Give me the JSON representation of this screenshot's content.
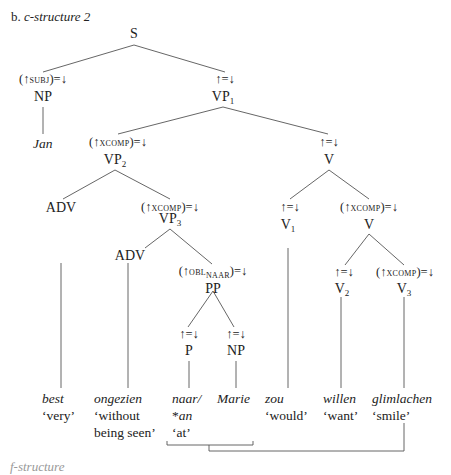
{
  "title": {
    "label": "b.",
    "text": "c-structure 2"
  },
  "nodes": {
    "S": {
      "cat": "S"
    },
    "NP_subj": {
      "ann_pre": "(↑",
      "ann_sc": "subj",
      "ann_post": ")=↓",
      "cat": "NP"
    },
    "VP1": {
      "ann": "↑=↓",
      "cat": "VP",
      "sub": "1"
    },
    "VP2": {
      "ann_pre": "(↑",
      "ann_sc": "xcomp",
      "ann_post": ")=↓",
      "cat": "VP",
      "sub": "2"
    },
    "V_top": {
      "ann": "↑=↓",
      "cat": "V"
    },
    "ADV1": {
      "cat": "ADV"
    },
    "VP3": {
      "ann_pre": "(↑",
      "ann_sc": "xcomp",
      "ann_post": ")=↓",
      "cat": "VP",
      "sub": "3"
    },
    "V1": {
      "ann": "↑=↓",
      "cat": "V",
      "sub": "1"
    },
    "V_mid": {
      "ann_pre": "(↑",
      "ann_sc": "xcomp",
      "ann_post": ")=↓",
      "cat": "V"
    },
    "ADV2": {
      "cat": "ADV"
    },
    "PP": {
      "ann_pre": "(↑",
      "ann_sc": "obl",
      "ann_sub": "naar",
      "ann_post": ")=↓",
      "cat": "PP"
    },
    "V2": {
      "ann": "↑=↓",
      "cat": "V",
      "sub": "2"
    },
    "V3": {
      "ann_pre": "(↑",
      "ann_sc": "xcomp",
      "ann_post": ")=↓",
      "cat": "V",
      "sub": "3"
    },
    "P": {
      "ann": "↑=↓",
      "cat": "P"
    },
    "NP_obj": {
      "ann": "↑=↓",
      "cat": "NP"
    }
  },
  "words": {
    "jan": {
      "form": "Jan"
    },
    "best": {
      "form": "best",
      "gloss": "‘very’"
    },
    "ongezien": {
      "form": "ongezien",
      "gloss1": "‘without",
      "gloss2": "being seen’"
    },
    "naar": {
      "form": "naar/",
      "form2": "*an",
      "gloss": "‘at’"
    },
    "marie": {
      "form": "Marie"
    },
    "zou": {
      "form": "zou",
      "gloss": "‘would’"
    },
    "willen": {
      "form": "willen",
      "gloss": "‘want’"
    },
    "glimlachen": {
      "form": "glimlachen",
      "gloss": "‘smile’"
    }
  },
  "footer": {
    "text": "f-structure"
  }
}
